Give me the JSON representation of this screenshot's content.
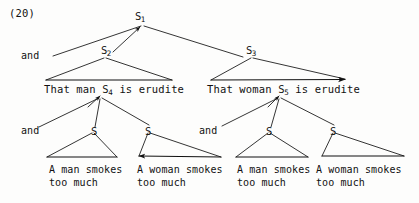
{
  "figure": {
    "example_number": "(20)",
    "type": "syntactic-tree-diagram",
    "ink_color": "#111111",
    "background_color": "#fdfdfc"
  },
  "nodes": {
    "root": {
      "label": "S",
      "subscript": "1"
    },
    "left_clause": {
      "label": "S",
      "subscript": "2"
    },
    "right_clause": {
      "label": "S",
      "subscript": "3"
    },
    "left_embedded": {
      "label": "S",
      "subscript": "4"
    },
    "right_embedded": {
      "label": "S",
      "subscript": "5"
    },
    "bare_s_1": {
      "label": "S",
      "subscript": ""
    },
    "bare_s_2": {
      "label": "S",
      "subscript": ""
    },
    "bare_s_3": {
      "label": "S",
      "subscript": ""
    },
    "bare_s_4": {
      "label": "S",
      "subscript": ""
    }
  },
  "conjunctions": {
    "top": "and",
    "left_lower": "and",
    "right_lower": "and"
  },
  "sentences": {
    "left_matrix": {
      "before": "That man ",
      "embedded_label": "S",
      "embedded_subscript": "4",
      "after": " is erudite"
    },
    "right_matrix": {
      "before": "That woman ",
      "embedded_label": "S",
      "embedded_subscript": "5",
      "after": " is erudite"
    }
  },
  "leaves": [
    {
      "line1": "A man smokes",
      "line2": "too much"
    },
    {
      "line1": "A woman smokes",
      "line2": "too much"
    },
    {
      "line1": "A man smokes",
      "line2": "too much"
    },
    {
      "line1": "A woman smokes",
      "line2": "too much"
    }
  ]
}
